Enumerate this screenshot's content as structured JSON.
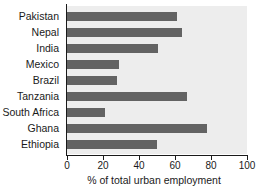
{
  "chart_data": {
    "type": "bar",
    "orientation": "horizontal",
    "title": "",
    "xlabel": "% of total urban employment",
    "ylabel": "",
    "categories": [
      "Pakistan",
      "Nepal",
      "India",
      "Mexico",
      "Brazil",
      "Tanzania",
      "South Africa",
      "Ghana",
      "Ethiopia"
    ],
    "values": [
      61,
      64,
      50.5,
      29,
      28,
      66.5,
      21,
      78,
      50
    ],
    "xlim": [
      0,
      100
    ],
    "xticks": [
      0,
      20,
      40,
      60,
      80,
      100
    ],
    "xtick_labels": [
      "0",
      "20",
      "40",
      "60",
      "80",
      "100"
    ],
    "grid": false,
    "legend": null,
    "colors": {
      "bar": "#636363",
      "plot_background": "#ededed",
      "figure_background": "#ffffff",
      "axis": "#1a1a1a",
      "text": "#1a1a1a"
    }
  }
}
